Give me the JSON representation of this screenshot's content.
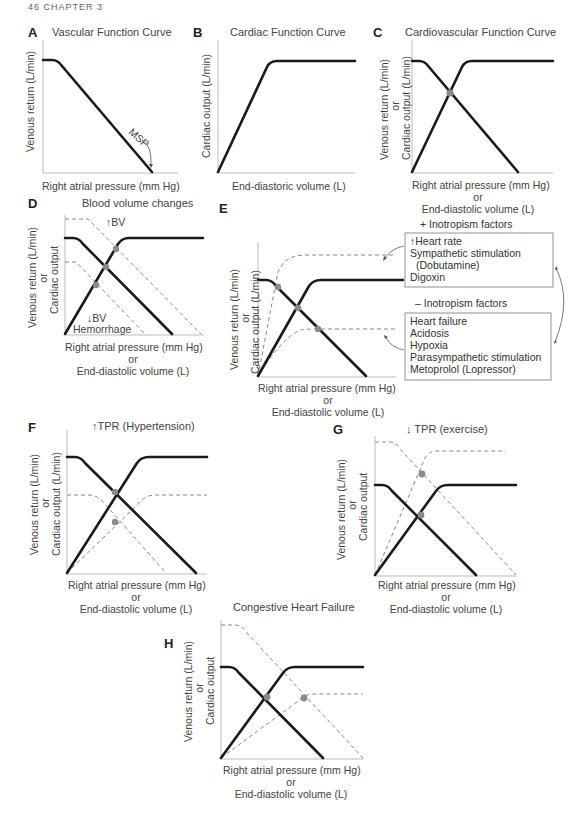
{
  "page_header": "46   CHAPTER 3",
  "axes": {
    "venous_return": "Venous return (L/min)",
    "cardiac_output": "Cardiac output (L/min)",
    "cardiac_output_short": "Cardiac output",
    "or": "or",
    "rap": "Right atrial pressure (mm Hg)",
    "edv": "End-diastolic volume (L)",
    "edv_b": "End-diastoric volume (L)"
  },
  "panels": {
    "A": {
      "label": "A",
      "title": "Vascular Function Curve",
      "annotation": "MSP"
    },
    "B": {
      "label": "B",
      "title": "Cardiac Function Curve"
    },
    "C": {
      "label": "C",
      "title": "Cardiovascular Function Curve"
    },
    "D": {
      "label": "D",
      "title": "Blood volume changes",
      "up_label": "↑BV",
      "down_label": "↓BV",
      "down_sub": "Hemorrhage"
    },
    "E": {
      "label": "E",
      "plus_title": "+ Inotropism factors",
      "plus_items": [
        "↑Heart rate",
        "Sympathetic stimulation",
        "(Dobutamine)",
        "Digoxin"
      ],
      "minus_title": "– Inotropism factors",
      "minus_items": [
        "Heart failure",
        "Acidosis",
        "Hypoxia",
        "Parasympathetic stimulation",
        "Metoprolol (Lopressor)"
      ]
    },
    "F": {
      "label": "F",
      "title": "↑TPR (Hypertension)"
    },
    "G": {
      "label": "G",
      "title": "↓ TPR (exercise)"
    },
    "H": {
      "label": "H",
      "title": "Congestive Heart Failure"
    }
  },
  "colors": {
    "solid_curve": "#1a1a1a",
    "dashed_curve": "#888888",
    "equilibrium_point": "#8a8a8a",
    "axis": "#bbbbbb"
  }
}
